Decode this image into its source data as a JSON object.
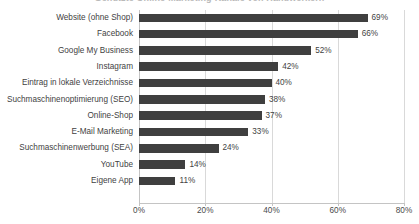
{
  "chart_data": {
    "type": "bar",
    "orientation": "horizontal",
    "title": "Genutzte Online-Marketing-Kanäle von Handwerkern",
    "xlabel": "",
    "ylabel": "",
    "xlim": [
      0,
      80
    ],
    "xticks": [
      "0%",
      "20%",
      "40%",
      "60%",
      "80%"
    ],
    "xtick_values": [
      0,
      20,
      40,
      60,
      80
    ],
    "grid": true,
    "legend": "none",
    "value_suffix": "%",
    "categories": [
      "Website (ohne Shop)",
      "Facebook",
      "Google My Business",
      "Instagram",
      "Eintrag in lokale Verzeichnisse",
      "Suchmaschinenoptimierung (SEO)",
      "Online-Shop",
      "E-Mail Marketing",
      "Suchmaschinenwerbung (SEA)",
      "YouTube",
      "Eigene App"
    ],
    "values": [
      69,
      66,
      52,
      42,
      40,
      38,
      37,
      33,
      24,
      14,
      11
    ],
    "value_labels": [
      "69%",
      "66%",
      "52%",
      "42%",
      "40%",
      "38%",
      "37%",
      "33%",
      "24%",
      "14%",
      "11%"
    ],
    "colors": {
      "bar": "#3f3f3f",
      "grid": "#d9d9d9",
      "axis": "#c4c4c4",
      "text": "#3f3f3f",
      "background": "#ffffff"
    }
  }
}
